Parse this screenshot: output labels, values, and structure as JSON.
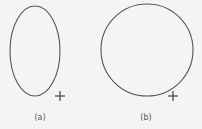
{
  "panels": [
    {
      "label": "(a)",
      "shape": "ellipse",
      "cx": 35,
      "cy": 51,
      "rx": 25,
      "ry": 45,
      "marker": {
        "type": "plus",
        "x": 60,
        "y": 96
      },
      "label_pos": {
        "x": 40,
        "y": 113
      }
    },
    {
      "label": "(b)",
      "shape": "circle",
      "cx": 147,
      "cy": 50,
      "r": 46,
      "marker": {
        "type": "plus",
        "x": 173,
        "y": 96
      },
      "label_pos": {
        "x": 146,
        "y": 113
      }
    }
  ],
  "colors": {
    "background": "#f4f4f2",
    "stroke": "#555555"
  }
}
